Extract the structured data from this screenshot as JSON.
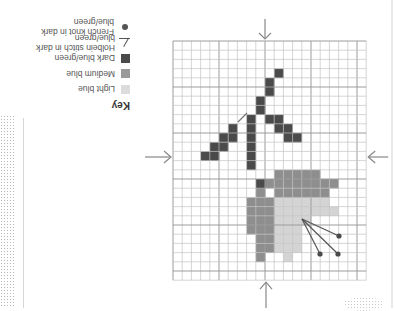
{
  "orientation": "rotated-180",
  "key": {
    "title": "Key",
    "items": [
      {
        "label": "Light blue",
        "symbol": "swatch",
        "color": "#dcdcdc"
      },
      {
        "label": "Medium blue",
        "symbol": "swatch",
        "color": "#9a9a9a"
      },
      {
        "label": "Dark blue/green",
        "symbol": "swatch",
        "color": "#4a4a4a"
      },
      {
        "label": "Holbein stitch in dark blue/green",
        "symbol": "line",
        "color": "#4a4a4a"
      },
      {
        "label": "French knot in dark blue/green",
        "symbol": "dot",
        "color": "#4a4a4a"
      }
    ]
  },
  "grid": {
    "origin_x": 173,
    "origin_y": 41,
    "cell": 9.2,
    "cols": 21,
    "rows": 26,
    "major_every": 5,
    "line_color": "#c4c4c4",
    "major_color": "#9c9c9c",
    "center_arrows": {
      "top_x": 265,
      "bottom_x": 266,
      "left_y": 157,
      "right_y": 157,
      "color": "#888888"
    }
  },
  "colors": {
    "dark": "#4a4a4a",
    "medium": "#8e8e8e",
    "light": "#d4d4d4"
  },
  "cells": {
    "dark": [
      [
        11,
        3
      ],
      [
        10,
        4
      ],
      [
        10,
        5
      ],
      [
        9,
        6
      ],
      [
        9,
        7
      ],
      [
        10,
        8
      ],
      [
        11,
        8
      ],
      [
        11,
        9
      ],
      [
        12,
        9
      ],
      [
        12,
        10
      ],
      [
        13,
        10
      ],
      [
        8,
        8
      ],
      [
        8,
        9
      ],
      [
        8,
        10
      ],
      [
        8,
        11
      ],
      [
        8,
        12
      ],
      [
        8,
        13
      ],
      [
        6,
        9
      ],
      [
        5,
        10
      ],
      [
        6,
        10
      ],
      [
        4,
        11
      ],
      [
        5,
        11
      ],
      [
        3,
        12
      ],
      [
        4,
        12
      ],
      [
        9,
        15
      ]
    ],
    "medium": [
      [
        11,
        14
      ],
      [
        12,
        14
      ],
      [
        13,
        14
      ],
      [
        14,
        14
      ],
      [
        15,
        14
      ],
      [
        10,
        15
      ],
      [
        11,
        15
      ],
      [
        12,
        15
      ],
      [
        13,
        15
      ],
      [
        14,
        15
      ],
      [
        15,
        15
      ],
      [
        16,
        15
      ],
      [
        17,
        15
      ],
      [
        9,
        16
      ],
      [
        11,
        16
      ],
      [
        12,
        16
      ],
      [
        13,
        16
      ],
      [
        14,
        16
      ],
      [
        15,
        16
      ],
      [
        16,
        16
      ],
      [
        8,
        17
      ],
      [
        9,
        17
      ],
      [
        10,
        17
      ],
      [
        8,
        18
      ],
      [
        9,
        18
      ],
      [
        10,
        18
      ],
      [
        8,
        19
      ],
      [
        9,
        19
      ],
      [
        10,
        19
      ],
      [
        8,
        20
      ],
      [
        9,
        20
      ],
      [
        10,
        20
      ],
      [
        9,
        21
      ],
      [
        10,
        21
      ],
      [
        9,
        22
      ],
      [
        10,
        22
      ],
      [
        9,
        23
      ]
    ],
    "light": [
      [
        11,
        17
      ],
      [
        12,
        17
      ],
      [
        13,
        17
      ],
      [
        14,
        17
      ],
      [
        15,
        17
      ],
      [
        16,
        17
      ],
      [
        11,
        18
      ],
      [
        12,
        18
      ],
      [
        13,
        18
      ],
      [
        14,
        18
      ],
      [
        15,
        18
      ],
      [
        16,
        18
      ],
      [
        17,
        18
      ],
      [
        11,
        19
      ],
      [
        12,
        19
      ],
      [
        13,
        19
      ],
      [
        14,
        19
      ],
      [
        11,
        20
      ],
      [
        12,
        20
      ],
      [
        13,
        20
      ],
      [
        11,
        21
      ],
      [
        12,
        21
      ],
      [
        13,
        21
      ],
      [
        11,
        22
      ],
      [
        12,
        22
      ],
      [
        13,
        22
      ],
      [
        12,
        23
      ]
    ]
  },
  "holbein": [
    {
      "x1": 238,
      "y1": 122,
      "x2": 247,
      "y2": 113
    }
  ],
  "stamens": {
    "origin": [
      302,
      219
    ],
    "knots": [
      [
        339,
        236
      ],
      [
        338,
        254
      ],
      [
        320,
        254
      ]
    ]
  }
}
